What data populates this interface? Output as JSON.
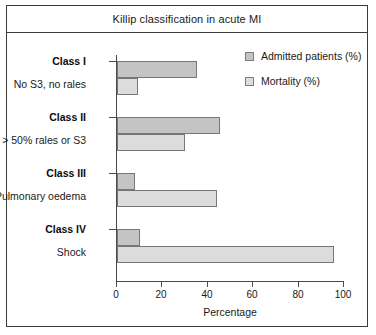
{
  "chart_data": {
    "type": "bar",
    "orientation": "horizontal",
    "title": "Killip classification in acute MI",
    "xlabel": "Percentage",
    "ylabel": "",
    "xlim": [
      0,
      100
    ],
    "xticks": [
      0,
      20,
      40,
      60,
      80,
      100
    ],
    "grid": false,
    "legend_position": "top-right",
    "categories": [
      "Class I",
      "Class II",
      "Class III",
      "Class IV"
    ],
    "category_descriptions": [
      "No S3, no rales",
      "> 50% rales or S3",
      "Pulmonary oedema",
      "Shock"
    ],
    "series": [
      {
        "name": "Admitted patients (%)",
        "color": "#c4c4c4",
        "values": [
          35,
          45,
          8,
          10
        ]
      },
      {
        "name": "Mortality (%)",
        "color": "#dcdcdc",
        "values": [
          9,
          30,
          44,
          95
        ]
      }
    ]
  },
  "legend": {
    "items": [
      {
        "label": "Admitted patients (%)",
        "swatch": "legend-swatch-admitted"
      },
      {
        "label": "Mortality (%)",
        "swatch": "legend-swatch-mortality"
      }
    ]
  },
  "axis": {
    "x_title": "Percentage",
    "tick_labels": [
      "0",
      "20",
      "40",
      "60",
      "80",
      "100"
    ]
  },
  "groups": [
    {
      "class_label": "Class I",
      "description": "No S3, no rales"
    },
    {
      "class_label": "Class II",
      "description": "> 50% rales or S3"
    },
    {
      "class_label": "Class III",
      "description": "Pulmonary oedema"
    },
    {
      "class_label": "Class IV",
      "description": "Shock"
    }
  ]
}
